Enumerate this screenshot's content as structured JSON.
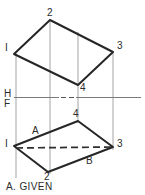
{
  "figure": {
    "caption": "A. GIVEN",
    "colors": {
      "object_line": "#262626",
      "projection_line": "#8c8c8c",
      "reference_line": "#6e6e6e",
      "hidden_line": "#333333",
      "text": "#2b2b2b",
      "background": "#ffffff"
    },
    "reference_line": {
      "above_label": "H",
      "below_label": "F",
      "above_label_x": 5,
      "above_label_y": 91,
      "below_label_x": 5,
      "below_label_y": 101,
      "y": 98,
      "x_start": 14,
      "x_end": 141
    },
    "views": [
      {
        "name": "horizontal-view",
        "position": "top",
        "shape": "quadrilateral",
        "vertices": [
          {
            "id": "1",
            "label": "I",
            "x": 14,
            "y": 54,
            "label_x": 6,
            "label_y": 44
          },
          {
            "id": "2",
            "label": "2",
            "x": 50,
            "y": 20,
            "label_x": 47,
            "label_y": 9
          },
          {
            "id": "3",
            "label": "3",
            "x": 113,
            "y": 52,
            "label_x": 117,
            "label_y": 42
          },
          {
            "id": "4",
            "label": "4",
            "x": 78,
            "y": 85,
            "label_x": 80,
            "label_y": 84
          }
        ]
      },
      {
        "name": "frontal-view",
        "position": "bottom",
        "shape": "quadrilateral",
        "vertices": [
          {
            "id": "1",
            "label": "I",
            "x": 14,
            "y": 146,
            "label_x": 6,
            "label_y": 139
          },
          {
            "id": "4",
            "label": "4",
            "x": 78,
            "y": 121,
            "label_x": 74,
            "label_y": 110
          },
          {
            "id": "3",
            "label": "3",
            "x": 113,
            "y": 147,
            "label_x": 117,
            "label_y": 140
          },
          {
            "id": "2",
            "label": "2",
            "x": 48,
            "y": 172,
            "label_x": 44,
            "label_y": 173
          }
        ]
      }
    ],
    "line_ab": {
      "name": "line-a-b",
      "style": "hidden-dashed",
      "points": [
        {
          "id": "A",
          "label": "A",
          "x": 40,
          "y": 137,
          "label_x": 32,
          "label_y": 127
        },
        {
          "id": "B",
          "label": "B",
          "x": 85,
          "y": 155,
          "label_x": 86,
          "label_y": 157
        }
      ],
      "extends_from": "1",
      "extends_to": "3"
    },
    "projection_lines": [
      {
        "name": "projector-point-1",
        "x": 16,
        "y_top": 54,
        "y_bottom": 178
      },
      {
        "name": "projector-point-2",
        "x": 50,
        "y_top": 20,
        "y_bottom": 174
      },
      {
        "name": "projector-point-4",
        "x": 78,
        "y_top": 32,
        "y_bottom": 123
      },
      {
        "name": "projector-point-3",
        "x": 113,
        "y_top": 52,
        "y_bottom": 150
      }
    ],
    "dash_marker": {
      "name": "center-dash-marker",
      "x_start": 61,
      "x_end": 74,
      "y": 97
    }
  }
}
